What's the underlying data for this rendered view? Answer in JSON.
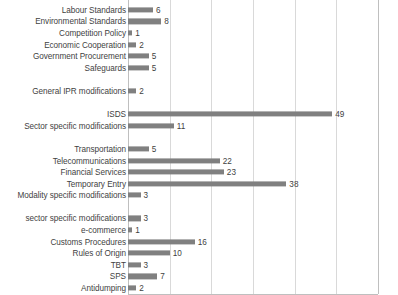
{
  "chart_data": {
    "type": "bar",
    "orientation": "horizontal",
    "title": "",
    "xlabel": "",
    "ylabel": "",
    "xlim": [
      0,
      60
    ],
    "xticks": [
      0,
      10,
      20,
      30,
      40,
      50,
      60
    ],
    "grid": true,
    "legend": "none",
    "bar_color": "#808080",
    "gridline_color": "#d9d9d9",
    "axis_color": "#bfbfbf",
    "categories": [
      "Labour Standards",
      "Environmental Standards",
      "Competition Policy",
      "Economic Cooperation",
      "Government Procurement",
      "Safeguards",
      "General IPR modifications",
      "ISDS",
      "Sector specific modifications",
      "Transportation",
      "Telecommunications",
      "Financial Services",
      "Temporary Entry",
      "Modality specific modifications",
      "sector specific modifications",
      "e-commerce",
      "Customs Procedures",
      "Rules of Origin",
      "TBT",
      "SPS",
      "Antidumping"
    ],
    "values": [
      6,
      8,
      1,
      2,
      5,
      5,
      2,
      49,
      11,
      5,
      22,
      23,
      38,
      3,
      3,
      1,
      16,
      10,
      3,
      7,
      2
    ],
    "rows": [
      {
        "kind": "bar",
        "label": "Labour Standards",
        "value": 6
      },
      {
        "kind": "bar",
        "label": "Environmental Standards",
        "value": 8
      },
      {
        "kind": "bar",
        "label": "Competition Policy",
        "value": 1
      },
      {
        "kind": "bar",
        "label": "Economic Cooperation",
        "value": 2
      },
      {
        "kind": "bar",
        "label": "Government Procurement",
        "value": 5
      },
      {
        "kind": "bar",
        "label": "Safeguards",
        "value": 5
      },
      {
        "kind": "gap",
        "label": "",
        "value": null
      },
      {
        "kind": "bar",
        "label": "General IPR modifications",
        "value": 2
      },
      {
        "kind": "gap",
        "label": "",
        "value": null
      },
      {
        "kind": "bar",
        "label": "ISDS",
        "value": 49
      },
      {
        "kind": "bar",
        "label": "Sector specific modifications",
        "value": 11
      },
      {
        "kind": "gap",
        "label": "",
        "value": null
      },
      {
        "kind": "bar",
        "label": "Transportation",
        "value": 5
      },
      {
        "kind": "bar",
        "label": "Telecommunications",
        "value": 22
      },
      {
        "kind": "bar",
        "label": "Financial Services",
        "value": 23
      },
      {
        "kind": "bar",
        "label": "Temporary Entry",
        "value": 38
      },
      {
        "kind": "bar",
        "label": "Modality specific modifications",
        "value": 3
      },
      {
        "kind": "gap",
        "label": "",
        "value": null
      },
      {
        "kind": "bar",
        "label": "sector specific modifications",
        "value": 3
      },
      {
        "kind": "bar",
        "label": "e-commerce",
        "value": 1
      },
      {
        "kind": "bar",
        "label": "Customs Procedures",
        "value": 16
      },
      {
        "kind": "bar",
        "label": "Rules of Origin",
        "value": 10
      },
      {
        "kind": "bar",
        "label": "TBT",
        "value": 3
      },
      {
        "kind": "bar",
        "label": "SPS",
        "value": 7
      },
      {
        "kind": "bar",
        "label": "Antidumping",
        "value": 2
      }
    ],
    "tick_labels": [
      "0",
      "10",
      "20",
      "30",
      "40",
      "50",
      "60"
    ]
  }
}
